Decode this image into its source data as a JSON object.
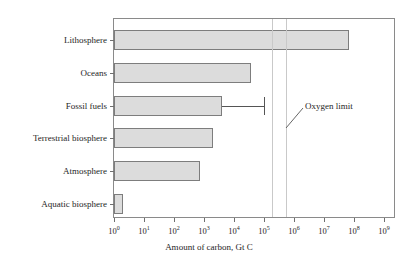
{
  "chart_data": {
    "type": "bar",
    "orientation": "horizontal",
    "title": "",
    "xlabel": "Amount of carbon, Gt C",
    "ylabel": "",
    "xscale": "log",
    "xlim": [
      1,
      1000000000
    ],
    "grid": false,
    "legend": null,
    "categories": [
      "Lithosphere",
      "Oceans",
      "Fossil fuels",
      "Terrestrial biosphere",
      "Atmosphere",
      "Aquatic biosphere"
    ],
    "values": [
      66000000,
      38000,
      4000,
      2000,
      720,
      2
    ],
    "value_labels": [
      "6.6×10⁷",
      "3.8×10⁴",
      "4×10³",
      "2×10³",
      "7.2×10²",
      "2"
    ],
    "error_bars": [
      {
        "category": "Fossil fuels",
        "upper": 100000,
        "upper_label": "1×10⁵"
      }
    ],
    "xticks": [
      1,
      10,
      100,
      1000,
      10000,
      100000,
      1000000,
      10000000,
      100000000,
      1000000000
    ],
    "xticklabels": [
      {
        "base": "10",
        "exp": "0"
      },
      {
        "base": "10",
        "exp": "1"
      },
      {
        "base": "10",
        "exp": "2"
      },
      {
        "base": "10",
        "exp": "3"
      },
      {
        "base": "10",
        "exp": "4"
      },
      {
        "base": "10",
        "exp": "5"
      },
      {
        "base": "10",
        "exp": "6"
      },
      {
        "base": "10",
        "exp": "7"
      },
      {
        "base": "10",
        "exp": "8"
      },
      {
        "base": "10",
        "exp": "9"
      }
    ],
    "reference_lines": [
      {
        "label": "Oxygen limit",
        "value": 190000
      },
      {
        "label": "Oxygen limit",
        "value": 550000
      }
    ],
    "annotations": [
      {
        "text": "Oxygen limit",
        "points_to": "reference-lines"
      }
    ],
    "colors": {
      "bar_fill": "#dcdcdc",
      "bar_edge": "#7d7d7d",
      "frame": "#8a8a8a",
      "reference_line": "#c9c9c9",
      "error_bar": "#555555",
      "text": "#1e1e1e",
      "background": "#ffffff"
    }
  }
}
